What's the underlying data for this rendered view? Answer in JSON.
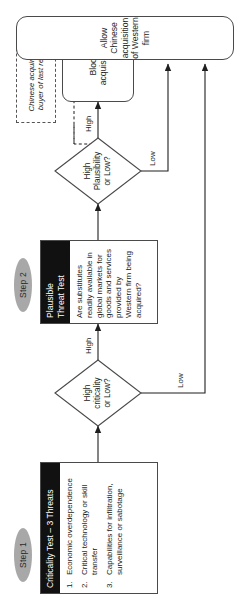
{
  "diagram": {
    "orientation": "rotated-90-ccw"
  },
  "steps": [
    {
      "id": "step1",
      "label": "Step 1"
    },
    {
      "id": "step2",
      "label": "Step 2"
    }
  ],
  "panels": {
    "criticality": {
      "title": "Criticality Test – 3 Threats",
      "items": [
        {
          "num": "1.",
          "text": "Economic overdependence"
        },
        {
          "num": "2.",
          "text": "Critical technology or skill transfer"
        },
        {
          "num": "3.",
          "text": "Capabilities for infiltration, surveillance or sabotage"
        }
      ]
    },
    "plausible": {
      "title": "Plausible\nThreat Test",
      "question": "Are substitutes readily available in global markets for goods and services provided by Western firm being acquired?"
    }
  },
  "decisions": [
    {
      "id": "criticality-decision",
      "label": "High\ncriticality\nor Low?",
      "high_label": "High",
      "low_label": "Low"
    },
    {
      "id": "plausibility-decision",
      "label": "High\nPlausibility\nor Low?",
      "high_label": "High",
      "low_label": "Low"
    }
  ],
  "outcomes": {
    "block": "Block\nacquisition",
    "allow": "Allow Chinese acquisition of Western firm"
  },
  "notes": {
    "last_resort": "Chinese acquirer is\nbuyer of last resort"
  },
  "colors": {
    "pill": "#a8a8a8",
    "panel_header": "#111111",
    "stroke": "#4a4a4a",
    "background": "#ffffff"
  }
}
